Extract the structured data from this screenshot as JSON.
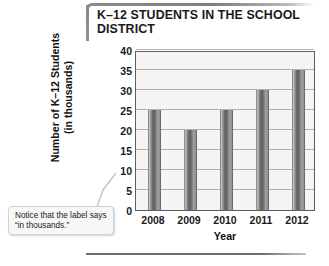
{
  "chart_data": {
    "type": "bar",
    "title": "K–12 STUDENTS IN THE SCHOOL DISTRICT",
    "categories": [
      "2008",
      "2009",
      "2010",
      "2011",
      "2012"
    ],
    "values": [
      25,
      20,
      25,
      30,
      35
    ],
    "xlabel": "Year",
    "ylabel_line1": "Number of K–12 Students",
    "ylabel_line2": "(in thousands)",
    "ylim": [
      0,
      40
    ],
    "yticks": [
      40,
      35,
      30,
      25,
      20,
      15,
      10,
      5,
      0
    ],
    "grid": true,
    "legend": false,
    "series_color": "#6f6f6f",
    "plot_background": "#f4f4f4",
    "gridline_color": "#b0b0b0"
  },
  "annotation": {
    "callout_text": "Notice that the label says “in thousands.”"
  }
}
